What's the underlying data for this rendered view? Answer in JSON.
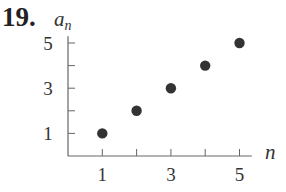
{
  "problem_number": "19.",
  "chart_data": {
    "type": "scatter",
    "title": "",
    "xlabel": "n",
    "ylabel": "a_n",
    "x": [
      1,
      2,
      3,
      4,
      5
    ],
    "values": [
      1,
      2,
      3,
      4,
      5
    ],
    "x_ticks": [
      1,
      2,
      3,
      4,
      5
    ],
    "x_tick_labels": [
      "1",
      "3",
      "5"
    ],
    "y_ticks": [
      1,
      2,
      3,
      4,
      5
    ],
    "y_tick_labels": [
      "1",
      "3",
      "5"
    ],
    "xlim": [
      0,
      5.3
    ],
    "ylim": [
      0,
      5.3
    ],
    "grid": false,
    "legend": null,
    "point_color": "#333333"
  }
}
